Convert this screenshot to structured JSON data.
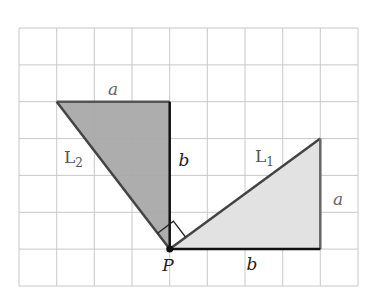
{
  "diagram": {
    "grid": {
      "cols": 9,
      "rows": 7,
      "left": 19,
      "top": 28,
      "cell_w": 37.67,
      "cell_h": 36.86,
      "line_color": "#c8c8c8"
    },
    "point_P": {
      "label": "P",
      "grid": [
        4,
        6
      ]
    },
    "triangle_L2": {
      "name": "L",
      "subscript": "2",
      "vertices_grid": [
        [
          1,
          2
        ],
        [
          4,
          2
        ],
        [
          4,
          6
        ]
      ],
      "fill": "#a9a9a9",
      "side_top_label": "a",
      "side_vertical_label": "b"
    },
    "triangle_L1": {
      "name": "L",
      "subscript": "1",
      "vertices_grid": [
        [
          4,
          6
        ],
        [
          8,
          6
        ],
        [
          8,
          3
        ]
      ],
      "fill": "#e2e2e2",
      "side_bottom_label": "b",
      "side_vertical_label": "a"
    },
    "right_angle_marker": "at P between hypotenuses of L1 and L2",
    "colors": {
      "edge_dark": "#111111",
      "edge_gray": "#555555",
      "label_gray": "#666666",
      "label_dark": "#222222"
    }
  }
}
